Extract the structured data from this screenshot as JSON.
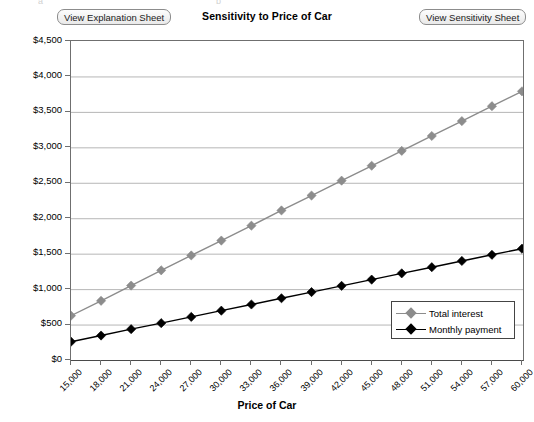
{
  "window": {
    "ghost_top_left": "a",
    "ghost_top_right": "b"
  },
  "buttons": {
    "explanation": "View Explanation Sheet",
    "sensitivity": "View Sensitivity Sheet"
  },
  "colors": {
    "total_interest": "#8c8c8c",
    "monthly_payment": "#000000",
    "grid": "#b6b6b6",
    "axis": "#6f6f6f",
    "plot_background": "#ffffff"
  },
  "chart_data": {
    "type": "line",
    "title": "Sensitivity to Price of Car",
    "xlabel": "Price of Car",
    "ylabel": "",
    "grid": true,
    "legend_position": "inside-bottom-right",
    "categories": [
      "15,000",
      "18,000",
      "21,000",
      "24,000",
      "27,000",
      "30,000",
      "33,000",
      "36,000",
      "39,000",
      "42,000",
      "45,000",
      "48,000",
      "51,000",
      "54,000",
      "57,000",
      "60,000"
    ],
    "x_tick_labels": [
      "15,000",
      "18,000",
      "21,000",
      "24,000",
      "27,000",
      "30,000",
      "33,000",
      "36,000",
      "39,000",
      "42,000",
      "45,000",
      "48,000",
      "51,000",
      "54,000",
      "57,000",
      "60,000"
    ],
    "y_tick_labels": [
      "$0",
      "$500",
      "$1,000",
      "$1,500",
      "$2,000",
      "$2,500",
      "$3,000",
      "$3,500",
      "$4,000",
      "$4,500"
    ],
    "y_tick_values": [
      0,
      500,
      1000,
      1500,
      2000,
      2500,
      3000,
      3500,
      4000,
      4500
    ],
    "ylim": [
      0,
      4500
    ],
    "series": [
      {
        "name": "Total interest",
        "color": "#8c8c8c",
        "marker": "diamond",
        "values": [
          625,
          835,
          1050,
          1265,
          1475,
          1685,
          1895,
          2110,
          2320,
          2530,
          2740,
          2950,
          3160,
          3370,
          3580,
          3790
        ]
      },
      {
        "name": "Monthly payment",
        "color": "#000000",
        "marker": "diamond",
        "values": [
          258,
          345,
          435,
          520,
          608,
          696,
          783,
          871,
          958,
          1046,
          1134,
          1222,
          1309,
          1397,
          1484,
          1570
        ]
      }
    ]
  }
}
